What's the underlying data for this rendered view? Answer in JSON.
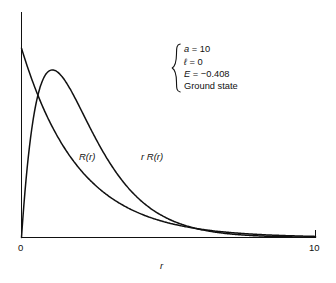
{
  "chart_data": {
    "type": "line",
    "title": "",
    "xlabel": "r",
    "ylabel": "",
    "xlim": [
      0,
      10
    ],
    "ylim": [
      0,
      1.08
    ],
    "grid": false,
    "legend_position": "inline-curve-labels",
    "xticks": [
      "0",
      "10"
    ],
    "xtick_values": [
      0,
      10
    ],
    "yticks": [],
    "series": [
      {
        "name": "R(r)",
        "label": "R(r)",
        "form": "exponential-decay",
        "description": "Radial wavefunction, maximum at r = 0, monotonic decay",
        "x": [
          0,
          0.25,
          0.5,
          0.75,
          1,
          1.25,
          1.5,
          1.75,
          2,
          2.5,
          3,
          3.5,
          4,
          4.5,
          5,
          5.5,
          6,
          6.5,
          7,
          7.5,
          8,
          8.5,
          9,
          9.5,
          10
        ],
        "values": [
          1.0,
          0.879,
          0.773,
          0.679,
          0.597,
          0.525,
          0.462,
          0.406,
          0.357,
          0.276,
          0.213,
          0.165,
          0.127,
          0.098,
          0.076,
          0.059,
          0.045,
          0.035,
          0.027,
          0.021,
          0.016,
          0.012,
          0.01,
          0.008,
          0.006
        ]
      },
      {
        "name": "rR(r)",
        "label": "r R(r)",
        "form": "r-times-exponential-decay",
        "description": "Radial probability amplitude, zero at r = 0, peak near r = 1.05",
        "peak_x": 1.05,
        "peak_y": 0.885,
        "x": [
          0,
          0.25,
          0.5,
          0.75,
          1,
          1.25,
          1.5,
          1.75,
          2,
          2.5,
          3,
          3.5,
          4,
          4.5,
          5,
          5.5,
          6,
          6.5,
          7,
          7.5,
          8,
          8.5,
          9,
          9.5,
          10
        ],
        "values": [
          0.0,
          0.315,
          0.554,
          0.73,
          0.855,
          0.941,
          0.993,
          1.019,
          1.024,
          0.989,
          0.916,
          0.827,
          0.729,
          0.632,
          0.543,
          0.464,
          0.387,
          0.325,
          0.271,
          0.225,
          0.183,
          0.151,
          0.129,
          0.107,
          0.09
        ]
      }
    ],
    "crossing_point": {
      "x": 0.38,
      "y": 0.72
    },
    "annotations": [
      {
        "text": "a = 10",
        "symbol": "a",
        "value": "10"
      },
      {
        "text": "ℓ = 0",
        "symbol": "ℓ",
        "value": "0"
      },
      {
        "text": "E = −0.408",
        "symbol": "E",
        "value": "−0.408"
      },
      {
        "text": "Ground state",
        "symbol": "",
        "value": ""
      }
    ]
  },
  "axes": {
    "x_label": "r",
    "tick_min_label": "0",
    "tick_max_label": "10"
  },
  "curve_labels": {
    "r_of_r": "R(r)",
    "r_times_r_of_r": "r R(r)"
  },
  "annotation": {
    "line1_symbol": "a",
    "line1_rest": " = 10",
    "line2_symbol": "ℓ",
    "line2_rest": " = 0",
    "line3_symbol": "E",
    "line3_rest": " = −0.408",
    "line4": "Ground state"
  },
  "colors": {
    "curve": "#111111",
    "axis": "#111111",
    "background": "#ffffff",
    "text": "#111111"
  }
}
